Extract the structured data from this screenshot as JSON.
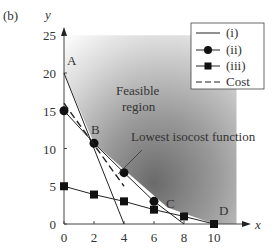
{
  "panel_label": "(b)",
  "chart_data": {
    "type": "line",
    "title": "",
    "xlabel": "x",
    "ylabel": "y",
    "xlim": [
      0,
      11
    ],
    "ylim": [
      0,
      25
    ],
    "x_ticks": [
      0,
      2,
      4,
      6,
      8,
      10
    ],
    "y_ticks": [
      0,
      5,
      10,
      15,
      20,
      25
    ],
    "x_tick_labels": [
      "0",
      "2",
      "4",
      "6",
      "8",
      "10"
    ],
    "y_tick_labels": [
      "0",
      "5",
      "10",
      "15",
      "20",
      "25"
    ],
    "grid": false,
    "legend_position": "upper right",
    "series": [
      {
        "name": "(i)",
        "style": "solid",
        "marker": "none",
        "x": [
          0,
          4
        ],
        "y": [
          20,
          0
        ]
      },
      {
        "name": "(ii)",
        "style": "solid",
        "marker": "circle",
        "x": [
          0,
          2,
          4,
          6,
          8
        ],
        "y": [
          15,
          10.7,
          6.8,
          3.0,
          0
        ],
        "marker_x": [
          0,
          2,
          4,
          6
        ],
        "marker_y": [
          15,
          10.7,
          6.8,
          3.0
        ]
      },
      {
        "name": "(iii)",
        "style": "solid",
        "marker": "square",
        "x": [
          0,
          2,
          4,
          6,
          8,
          10
        ],
        "y": [
          5,
          3.9,
          3.0,
          1.9,
          1.0,
          0
        ]
      },
      {
        "name": "Cost",
        "style": "dashed",
        "marker": "none",
        "x": [
          0,
          4
        ],
        "y": [
          16,
          5
        ]
      }
    ],
    "points": [
      {
        "label": "A",
        "x": 0,
        "y": 20
      },
      {
        "label": "B",
        "x": 2,
        "y": 10.7
      },
      {
        "label": "C",
        "x": 6.9,
        "y": 2.2
      },
      {
        "label": "D",
        "x": 10,
        "y": 0
      }
    ],
    "annotations": [
      {
        "text": "Feasible",
        "line": 1
      },
      {
        "text": "region",
        "line": 2
      },
      {
        "text": "Lowest isocost function",
        "points_to": {
          "x": 3.6,
          "y": 6.4
        }
      }
    ],
    "shaded_region": "Feasible region (above constraint boundary A-B-C-D)"
  },
  "legend": {
    "items": [
      {
        "label": "(i)"
      },
      {
        "label": "(ii)"
      },
      {
        "label": "(iii)"
      },
      {
        "label": "Cost"
      }
    ]
  },
  "labels": {
    "feasible_1": "Feasible",
    "feasible_2": "region",
    "isocost": "Lowest isocost function",
    "A": "A",
    "B": "B",
    "C": "C",
    "D": "D",
    "xaxis": "x",
    "yaxis": "y"
  }
}
